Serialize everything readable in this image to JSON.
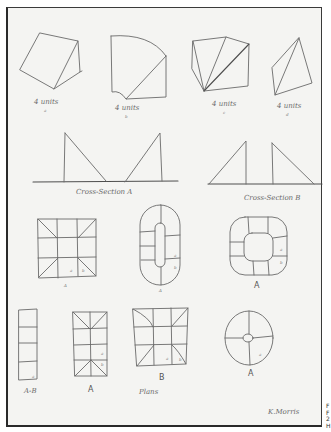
{
  "sketch": {
    "top_row": [
      {
        "label": "4 units",
        "sub": "a"
      },
      {
        "label": "4 units",
        "sub": "b"
      },
      {
        "label": "4 units",
        "sub": "c"
      },
      {
        "label": "4 units",
        "sub": "d"
      }
    ],
    "cross_sections": [
      {
        "label": "Cross-Section A"
      },
      {
        "label": "Cross-Section B"
      }
    ],
    "plans_row1": [
      {
        "label": "A",
        "cell_marks": [
          "a",
          "b"
        ]
      },
      {
        "label": "A",
        "cell_marks": [
          "a",
          "b"
        ]
      },
      {
        "label": "A",
        "cell_marks": [
          "a",
          "b"
        ]
      }
    ],
    "plans_row2": [
      {
        "label": "A-B",
        "cell_marks": [
          "a"
        ]
      },
      {
        "label": "A",
        "cell_marks": [
          "a",
          "b"
        ]
      },
      {
        "label": "B",
        "cell_marks": [
          "a",
          "b"
        ]
      },
      {
        "label": "A",
        "cell_marks": [
          "a"
        ]
      }
    ],
    "plans_caption": "Plans",
    "signature": "K.Morris",
    "side_caption": [
      "F",
      "F",
      "2",
      "H"
    ]
  }
}
